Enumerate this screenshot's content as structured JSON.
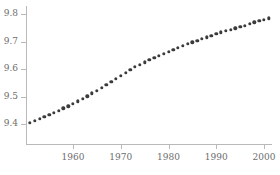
{
  "chart_data": {
    "type": "scatter",
    "title": "",
    "subtitle": "",
    "xlabel": "",
    "ylabel": "",
    "xlim": [
      1950.2,
      2001.8
    ],
    "ylim": [
      9.355,
      9.815
    ],
    "grid": false,
    "legend": null,
    "marker": {
      "shape": "circle",
      "color": "#3b3b3b",
      "size_px": 3.4
    },
    "axis_color": "#b9b9b9",
    "tick_label_color": "#6d6d6d",
    "background": "#ffffff",
    "xticks": [
      1960,
      1970,
      1980,
      1990,
      2000
    ],
    "xtick_labels": [
      "1960",
      "1970",
      "1980",
      "1990",
      "2000"
    ],
    "yticks": [
      9.4,
      9.5,
      9.6,
      9.7,
      9.8
    ],
    "ytick_labels": [
      "9.4",
      "9.5",
      "9.6",
      "9.7",
      "9.8"
    ],
    "x": [
      1951,
      1952,
      1953,
      1954,
      1955,
      1956,
      1957,
      1958,
      1959,
      1960,
      1961,
      1962,
      1963,
      1964,
      1965,
      1966,
      1967,
      1968,
      1969,
      1970,
      1971,
      1972,
      1973,
      1974,
      1975,
      1976,
      1977,
      1978,
      1979,
      1980,
      1981,
      1982,
      1983,
      1984,
      1985,
      1986,
      1987,
      1988,
      1989,
      1990,
      1991,
      1992,
      1993,
      1994,
      1995,
      1996,
      1997,
      1998,
      1999,
      2000,
      2001
    ],
    "values": [
      9.405,
      9.412,
      9.419,
      9.426,
      9.433,
      9.441,
      9.449,
      9.457,
      9.465,
      9.474,
      9.483,
      9.492,
      9.501,
      9.511,
      9.521,
      9.531,
      9.542,
      9.553,
      9.564,
      9.575,
      9.586,
      9.597,
      9.607,
      9.616,
      9.625,
      9.633,
      9.641,
      9.649,
      9.656,
      9.663,
      9.67,
      9.677,
      9.684,
      9.691,
      9.697,
      9.703,
      9.709,
      9.715,
      9.721,
      9.727,
      9.733,
      9.738,
      9.743,
      9.748,
      9.753,
      9.758,
      9.764,
      9.77,
      9.775,
      9.78,
      9.785
    ]
  }
}
